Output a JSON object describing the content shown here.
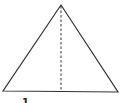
{
  "diagram": {
    "type": "isosceles-triangle-with-altitude",
    "stroke_color": "#333333",
    "background": "#ffffff",
    "vertices": {
      "apex": [
        61,
        5
      ],
      "base_left": [
        3,
        91
      ],
      "base_right": [
        118,
        92
      ]
    },
    "altitude": {
      "from": [
        61,
        5
      ],
      "to": [
        61,
        91
      ],
      "style": "dashed"
    },
    "labels": [
      {
        "text": "1",
        "position": [
          22,
          103
        ]
      }
    ]
  }
}
